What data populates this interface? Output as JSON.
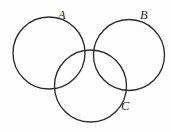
{
  "diagram": {
    "type": "venn-diagram",
    "background_color": "#fefefe",
    "stroke_color": "#2b2b2b",
    "stroke_width": 1.35,
    "canvas": {
      "width": 171,
      "height": 132
    },
    "circles": [
      {
        "id": "A",
        "label": "A",
        "cx": 49,
        "cy": 53,
        "r": 36
      },
      {
        "id": "B",
        "label": "B",
        "cx": 129,
        "cy": 55,
        "r": 35.5
      },
      {
        "id": "C",
        "label": "C",
        "cx": 90.5,
        "cy": 86,
        "r": 36
      }
    ],
    "labels": [
      {
        "id": "A",
        "text": "A",
        "x": 58,
        "y": 19
      },
      {
        "id": "B",
        "text": "B",
        "x": 140,
        "y": 19
      },
      {
        "id": "C",
        "text": "C",
        "x": 121,
        "y": 110
      }
    ]
  }
}
